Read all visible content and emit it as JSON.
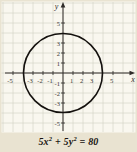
{
  "figure_caption_equation": {
    "t1": "5x",
    "e1": "2",
    "t2": " + 5y",
    "e2": "2",
    "t3": " = 80"
  },
  "chart_data": {
    "type": "line",
    "curve": "circle",
    "title": "",
    "equation": "5x^2 + 5y^2 = 80",
    "circle": {
      "center_x": 0,
      "center_y": 0,
      "radius": 4
    },
    "xlabel": "x",
    "ylabel": "y",
    "xlim": [
      -6,
      7
    ],
    "ylim": [
      -6,
      7
    ],
    "grid": true,
    "legend": false,
    "x_tick_labels": [
      "-5",
      "-3",
      "-2",
      "-1",
      "1",
      "2",
      "3",
      "5"
    ],
    "x_tick_values": [
      -5,
      -3,
      -2,
      -1,
      1,
      2,
      3,
      5
    ],
    "y_tick_labels": [
      "5",
      "3",
      "2",
      "1",
      "-1",
      "-2",
      "-3",
      "-5"
    ],
    "y_tick_values": [
      5,
      3,
      2,
      1,
      -1,
      -2,
      -3,
      -5
    ],
    "colors": {
      "background": "#e9e3d1",
      "plot_background": "#f9f7ef",
      "gridline": "#cfcec0",
      "axis": "#2e2b28",
      "tick_text": "#3c3833",
      "curve": "#14110e",
      "equation_text": "#171310"
    }
  }
}
